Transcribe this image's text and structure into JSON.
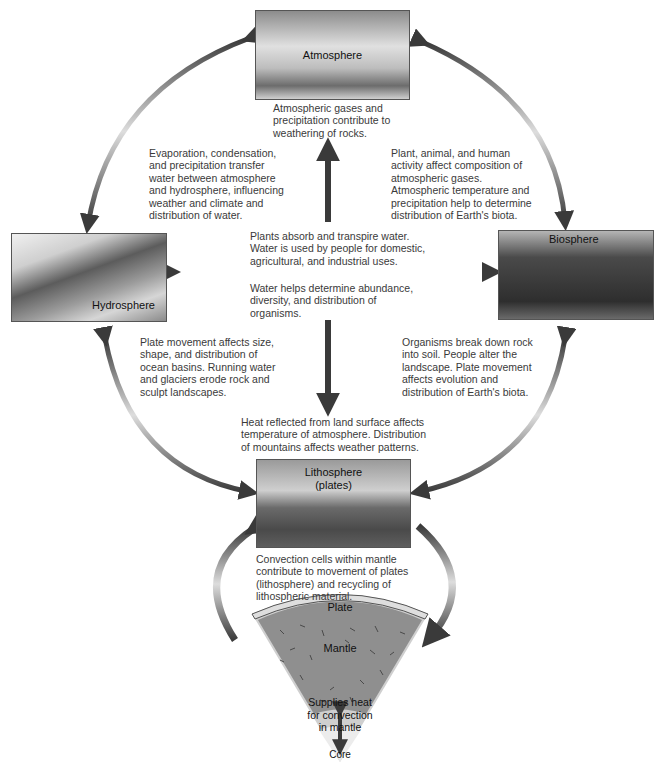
{
  "spheres": {
    "atmosphere": {
      "label": "Atmosphere"
    },
    "hydrosphere": {
      "label": "Hydrosphere"
    },
    "biosphere": {
      "label": "Biosphere"
    },
    "lithosphere": {
      "label_line1": "Lithosphere",
      "label_line2": "(plates)"
    }
  },
  "interactions": {
    "atmosphere_to_lithosphere": [
      "Atmospheric gases and",
      "precipitation contribute to",
      "weathering of rocks."
    ],
    "atmosphere_hydrosphere": [
      "Evaporation, condensation,",
      "and precipitation transfer",
      "water between atmosphere",
      "and hydrosphere, influencing",
      "weather and climate and",
      "distribution of water."
    ],
    "atmosphere_biosphere": [
      "Plant, animal, and human",
      "activity affect composition of",
      "atmospheric gases.",
      "Atmospheric temperature and",
      "precipitation help to determine",
      "distribution of Earth's biota."
    ],
    "biosphere_to_hydrosphere": [
      "Plants absorb and transpire water.",
      "Water is used by people for domestic,",
      "agricultural, and industrial uses."
    ],
    "hydrosphere_to_biosphere": [
      "Water helps determine abundance,",
      "diversity, and distribution of",
      "organisms."
    ],
    "hydrosphere_lithosphere": [
      "Plate movement affects size,",
      "shape, and distribution of",
      "ocean basins.  Running water",
      "and glaciers erode rock and",
      "sculpt landscapes."
    ],
    "biosphere_lithosphere": [
      "Organisms break down rock",
      "into soil.  People alter the",
      "landscape.  Plate movement",
      "affects evolution and",
      "distribution of Earth's biota."
    ],
    "lithosphere_to_atmosphere": [
      "Heat reflected from land surface affects",
      "temperature of atmosphere.  Distribution",
      "of mountains affects weather patterns."
    ],
    "mantle_convection": [
      "Convection cells within mantle",
      "contribute to movement of plates",
      "(lithosphere) and recycling of",
      "lithospheric material."
    ]
  },
  "earth_section": {
    "plate_label": "Plate",
    "mantle_label": "Mantle",
    "core_heat": [
      "Supplies heat",
      "for convection",
      "in mantle"
    ],
    "core_label": "Core"
  },
  "colors": {
    "arrow_dark": "#3c3c3c",
    "arrow_light": "#d8d8d8",
    "mantle": "#8f8f8f",
    "plate": "#d9d9d9",
    "core_outer": "#cfcfcf",
    "core_inner": "#ebebeb"
  }
}
